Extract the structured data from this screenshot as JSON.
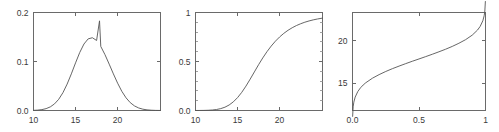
{
  "figure": {
    "background_color": "#ffffff",
    "line_color": "#555555",
    "frame_color": "#6a6a6a",
    "label_color": "#3a3a3a"
  },
  "chart_data": [
    {
      "type": "line",
      "title": "",
      "xlabel": "",
      "ylabel": "",
      "xlim": [
        10,
        25.1
      ],
      "ylim": [
        0,
        0.2
      ],
      "xticks": [
        10,
        15,
        20
      ],
      "xticklabels": [
        "10",
        "15",
        "20"
      ],
      "yticks": [
        0.0,
        0.1,
        0.2
      ],
      "yticklabels": [
        "0.0",
        "0.1",
        "0.2"
      ],
      "grid": false,
      "legend": "none",
      "description": "probability density function",
      "distribution": {
        "mean": 17.85,
        "sd": 2.18,
        "peak_value": 0.183
      },
      "x": [
        10.0,
        10.5,
        11.0,
        11.5,
        12.0,
        12.5,
        13.0,
        13.5,
        14.0,
        14.5,
        15.0,
        15.5,
        16.0,
        16.5,
        17.0,
        17.5,
        17.85,
        18.0,
        18.5,
        19.0,
        19.5,
        20.0,
        20.5,
        21.0,
        21.5,
        22.0,
        22.5,
        23.0,
        23.5,
        24.0,
        24.5,
        25.1
      ],
      "y": [
        0.0003,
        0.0008,
        0.0018,
        0.0038,
        0.0074,
        0.0135,
        0.0229,
        0.0364,
        0.0539,
        0.0748,
        0.0972,
        0.1185,
        0.1357,
        0.1462,
        0.1485,
        0.1429,
        0.183,
        0.1308,
        0.1139,
        0.0946,
        0.0747,
        0.0558,
        0.0392,
        0.0259,
        0.0161,
        0.0094,
        0.0052,
        0.0027,
        0.0013,
        0.0006,
        0.0002,
        0.0001
      ]
    },
    {
      "type": "line",
      "title": "",
      "xlabel": "",
      "ylabel": "",
      "xlim": [
        10,
        25.1
      ],
      "ylim": [
        0,
        1
      ],
      "xticks": [
        10,
        15,
        20
      ],
      "xticklabels": [
        "10",
        "15",
        "20"
      ],
      "yticks": [
        0.0,
        0.5,
        1
      ],
      "yticklabels": [
        "0.0",
        "0.5",
        "1"
      ],
      "yminorticks": [
        0.1,
        0.2,
        0.3,
        0.4,
        0.6,
        0.7,
        0.8,
        0.9
      ],
      "grid": false,
      "legend": "none",
      "description": "cumulative distribution function",
      "distribution": {
        "mean": 17.85,
        "sd": 2.18
      },
      "x": [
        10.0,
        10.5,
        11.0,
        11.5,
        12.0,
        12.5,
        13.0,
        13.5,
        14.0,
        14.5,
        15.0,
        15.5,
        16.0,
        16.5,
        17.0,
        17.5,
        18.0,
        18.5,
        19.0,
        19.5,
        20.0,
        20.5,
        21.0,
        21.5,
        22.0,
        22.5,
        23.0,
        23.5,
        24.0,
        24.5,
        25.1
      ],
      "y": [
        0.0001,
        0.0004,
        0.001,
        0.0023,
        0.005,
        0.0102,
        0.0192,
        0.0338,
        0.0562,
        0.0884,
        0.1314,
        0.1854,
        0.249,
        0.3197,
        0.3936,
        0.4673,
        0.5366,
        0.6005,
        0.6573,
        0.7072,
        0.7504,
        0.7871,
        0.8185,
        0.8447,
        0.8667,
        0.8852,
        0.9009,
        0.9139,
        0.9248,
        0.9338,
        0.9427
      ]
    },
    {
      "type": "line",
      "title": "",
      "xlabel": "",
      "ylabel": "",
      "xlim": [
        0,
        1
      ],
      "ylim": [
        11.8,
        23.3
      ],
      "xticks": [
        0.0,
        0.5,
        1
      ],
      "xticklabels": [
        "0.0",
        "0.5",
        "1"
      ],
      "yticks": [
        15,
        20
      ],
      "yticklabels": [
        "15",
        "20"
      ],
      "grid": false,
      "legend": "none",
      "description": "quantile function (inverse CDF)",
      "distribution": {
        "mean": 17.85,
        "sd": 2.18
      },
      "x": [
        0.001,
        0.005,
        0.01,
        0.02,
        0.04,
        0.06,
        0.08,
        0.1,
        0.15,
        0.2,
        0.25,
        0.3,
        0.35,
        0.4,
        0.45,
        0.5,
        0.55,
        0.6,
        0.65,
        0.7,
        0.75,
        0.8,
        0.85,
        0.9,
        0.94,
        0.96,
        0.98,
        0.99,
        0.995,
        0.999
      ],
      "y": [
        11.11,
        12.23,
        12.78,
        13.37,
        14.03,
        14.46,
        14.79,
        15.06,
        15.59,
        16.01,
        16.38,
        16.71,
        17.01,
        17.3,
        17.58,
        17.85,
        18.12,
        18.4,
        18.69,
        18.99,
        19.32,
        19.69,
        20.11,
        20.64,
        21.24,
        21.67,
        22.33,
        22.92,
        23.47,
        24.59
      ]
    }
  ]
}
